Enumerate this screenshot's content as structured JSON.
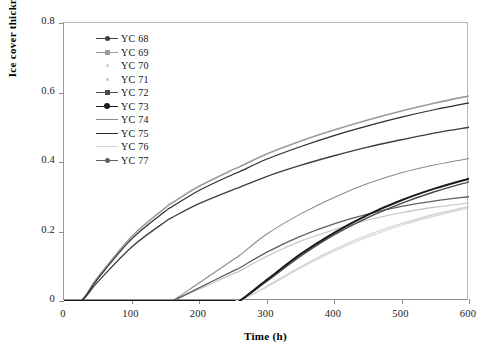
{
  "chart_data": {
    "type": "line",
    "title": "",
    "xlabel": "Time (h)",
    "ylabel": "Ice cover thickness (m)",
    "xlim": [
      0,
      600
    ],
    "ylim": [
      0,
      0.8
    ],
    "xticks": [
      "0",
      "100",
      "200",
      "300",
      "400",
      "500",
      "600"
    ],
    "xtick_values": [
      0,
      100,
      200,
      300,
      400,
      500,
      600
    ],
    "yticks": [
      "0",
      "0.2",
      "0.4",
      "0.6",
      "0.8"
    ],
    "ytick_values": [
      0,
      0.2,
      0.4,
      0.6,
      0.8
    ],
    "grid": false,
    "legend_position": "upper left",
    "x": [
      0,
      25,
      50,
      100,
      150,
      160,
      200,
      250,
      260,
      300,
      350,
      400,
      450,
      500,
      550,
      600
    ],
    "series": [
      {
        "name": "YC 68",
        "color": "#3d3d3d",
        "width": 1.3,
        "marker": "line-dot",
        "onset": 25,
        "final": 0.5,
        "values": [
          0,
          0,
          0.055,
          0.155,
          0.228,
          0.24,
          0.28,
          0.32,
          0.327,
          0.358,
          0.39,
          0.418,
          0.443,
          0.464,
          0.484,
          0.5
        ]
      },
      {
        "name": "YC 69",
        "color": "#9b9b9b",
        "width": 1.6,
        "marker": "line-square",
        "onset": 25,
        "final": 0.59,
        "values": [
          0,
          0,
          0.068,
          0.185,
          0.268,
          0.282,
          0.33,
          0.378,
          0.386,
          0.423,
          0.46,
          0.492,
          0.521,
          0.547,
          0.57,
          0.59
        ]
      },
      {
        "name": "YC 70",
        "color": "#cfcfcf",
        "width": 1.2,
        "marker": "dot-faint",
        "onset": 262,
        "final": 0.272,
        "values": [
          0,
          0,
          0,
          0,
          0,
          0,
          0,
          0,
          0,
          0.042,
          0.098,
          0.148,
          0.19,
          0.223,
          0.25,
          0.272
        ]
      },
      {
        "name": "YC 71",
        "color": "#c2c2c2",
        "width": 1.2,
        "marker": "dot-faint",
        "onset": 160,
        "final": 0.282,
        "values": [
          0,
          0,
          0,
          0,
          0,
          0,
          0.034,
          0.078,
          0.086,
          0.128,
          0.172,
          0.205,
          0.233,
          0.254,
          0.27,
          0.282
        ]
      },
      {
        "name": "YC 72",
        "color": "#4a4a4a",
        "width": 1.4,
        "marker": "line-square",
        "onset": 262,
        "final": 0.343,
        "values": [
          0,
          0,
          0,
          0,
          0,
          0,
          0,
          0,
          0,
          0.056,
          0.128,
          0.19,
          0.24,
          0.281,
          0.315,
          0.343
        ]
      },
      {
        "name": "YC 73",
        "color": "#1a1a1a",
        "width": 2.0,
        "marker": "line-dot-bold",
        "onset": 262,
        "final": 0.352,
        "values": [
          0,
          0,
          0,
          0,
          0,
          0,
          0,
          0,
          0,
          0.06,
          0.134,
          0.196,
          0.248,
          0.29,
          0.324,
          0.352
        ]
      },
      {
        "name": "YC 74",
        "color": "#8a8a8a",
        "width": 1.1,
        "marker": "line-plain",
        "onset": 160,
        "final": 0.41,
        "values": [
          0,
          0,
          0,
          0,
          0,
          0,
          0.052,
          0.118,
          0.131,
          0.192,
          0.25,
          0.298,
          0.338,
          0.369,
          0.392,
          0.41
        ]
      },
      {
        "name": "YC 75",
        "color": "#2c2c2c",
        "width": 1.2,
        "marker": "line-plain",
        "onset": 25,
        "final": 0.57,
        "values": [
          0,
          0,
          0.064,
          0.178,
          0.258,
          0.271,
          0.318,
          0.364,
          0.372,
          0.408,
          0.444,
          0.476,
          0.504,
          0.529,
          0.551,
          0.57
        ]
      },
      {
        "name": "YC 76",
        "color": "#d5d5d5",
        "width": 1.2,
        "marker": "line-faint",
        "onset": 262,
        "final": 0.268,
        "values": [
          0,
          0,
          0,
          0,
          0,
          0,
          0,
          0,
          0,
          0.04,
          0.094,
          0.143,
          0.184,
          0.218,
          0.245,
          0.268
        ]
      },
      {
        "name": "YC 77",
        "color": "#5f5f5f",
        "width": 1.3,
        "marker": "line-dot",
        "onset": 160,
        "final": 0.3,
        "values": [
          0,
          0,
          0,
          0,
          0,
          0,
          0.038,
          0.086,
          0.095,
          0.14,
          0.186,
          0.222,
          0.25,
          0.272,
          0.288,
          0.3
        ]
      }
    ]
  },
  "axes": {
    "y_title": "Ice cover thickness (m)",
    "x_title": "Time (h)"
  }
}
